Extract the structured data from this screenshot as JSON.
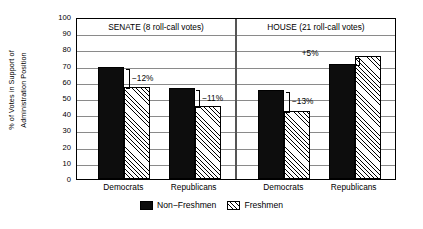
{
  "chart_data": {
    "type": "bar",
    "title": "",
    "xlabel": "",
    "ylabel_line1": "% of Votes in Support of",
    "ylabel_line2": "Administration Position",
    "ylim": [
      0,
      100
    ],
    "yticks": [
      0,
      10,
      20,
      30,
      40,
      50,
      60,
      70,
      80,
      90,
      100
    ],
    "grid": true,
    "legend_position": "bottom-center",
    "panels": [
      {
        "name": "senate",
        "title": "SENATE (8 roll-call votes)",
        "categories": [
          "Democrats",
          "Republicans"
        ],
        "groups": [
          {
            "category": "Democrats",
            "non_freshmen": 69,
            "freshmen": 57,
            "annotation": "−12%",
            "annotation_side": "right"
          },
          {
            "category": "Republicans",
            "non_freshmen": 56,
            "freshmen": 45,
            "annotation": "−11%",
            "annotation_side": "right"
          }
        ]
      },
      {
        "name": "house",
        "title": "HOUSE (21 roll-call votes)",
        "categories": [
          "Democrats",
          "Republicans"
        ],
        "groups": [
          {
            "category": "Democrats",
            "non_freshmen": 55,
            "freshmen": 42,
            "annotation": "−13%",
            "annotation_side": "right"
          },
          {
            "category": "Republicans",
            "non_freshmen": 71,
            "freshmen": 76,
            "annotation": "+5%",
            "annotation_side": "left"
          }
        ]
      }
    ],
    "series": [
      {
        "name": "Non−Freshmen",
        "style": "solid-black",
        "values": [
          69,
          56,
          55,
          71
        ]
      },
      {
        "name": "Freshmen",
        "style": "hatched",
        "values": [
          57,
          45,
          42,
          76
        ]
      }
    ],
    "legend": [
      {
        "label": "Non−Freshmen",
        "style": "solid-black"
      },
      {
        "label": "Freshmen",
        "style": "hatched"
      }
    ]
  }
}
